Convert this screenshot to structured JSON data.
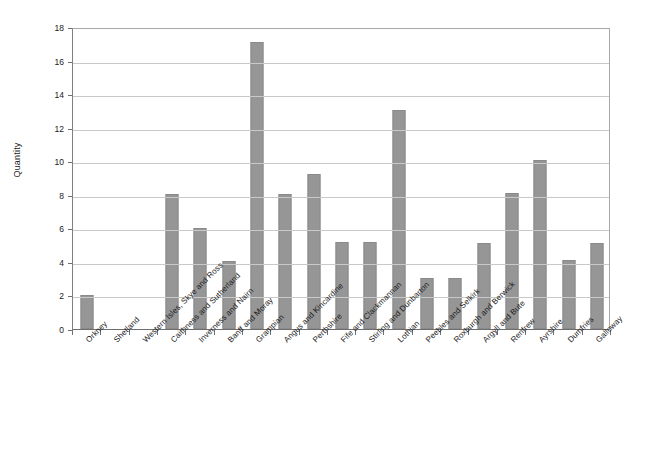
{
  "chart_data": {
    "type": "bar",
    "title": "",
    "subtitle": "",
    "xlabel": "",
    "ylabel": "Quantity",
    "ylim": [
      0,
      18
    ],
    "ytick_step": 2,
    "yticks": [
      0,
      2,
      4,
      6,
      8,
      10,
      12,
      14,
      16,
      18
    ],
    "grid": true,
    "legend": false,
    "legend_position": "none",
    "bar_color": "#969696",
    "bar_border_color": "#8a8a8a",
    "gridline_color": "#c9c9c9",
    "axis_color": "#707070",
    "categories": [
      "Orkney",
      "Shetland",
      "Western Isles, Skye and Ross",
      "Caithness and Sutherland",
      "Inverness and Nairn",
      "Banff and Moray",
      "Grampian",
      "Angus and Kincardine",
      "Perthshire",
      "Fife and Clackmannan",
      "Stirling and Dunbarton",
      "Lothian",
      "Peebles and Selkirk",
      "Roxburgh and Berwick",
      "Argyll and Bute",
      "Renfrew",
      "Ayrshire",
      "Dumfries",
      "Galloway"
    ],
    "values": [
      2.0,
      0,
      0,
      8.05,
      6.0,
      4.05,
      17.1,
      8.05,
      9.25,
      5.2,
      5.2,
      13.05,
      3.05,
      3.05,
      5.1,
      8.1,
      10.1,
      4.1,
      5.15
    ]
  }
}
